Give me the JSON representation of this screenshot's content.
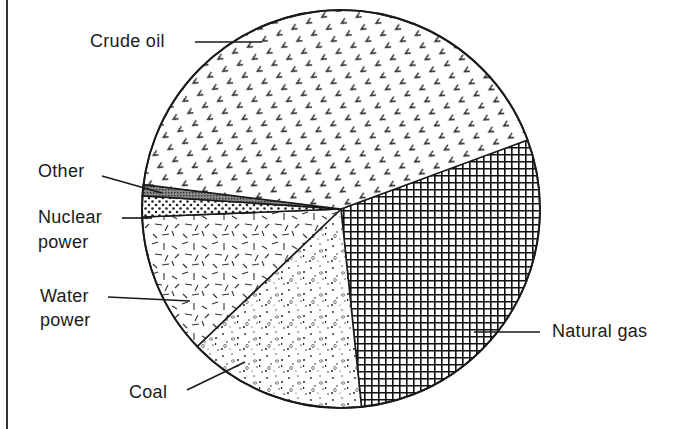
{
  "chart_data": {
    "type": "pie",
    "title": "",
    "start_angle_deg": 69.7,
    "direction": "clockwise",
    "units": "percent (estimated from slice angles)",
    "categories": [
      "Natural gas",
      "Coal",
      "Water power",
      "Nuclear power",
      "Other",
      "Crude oil"
    ],
    "values": [
      29.0,
      14.5,
      11.5,
      1.7,
      0.9,
      42.4
    ],
    "patterns": [
      "crosshatch-grid",
      "stipple-dots-circles",
      "random-dashes",
      "dot-grid",
      "dense-dark-stipple",
      "chevron-marks"
    ],
    "labels": {
      "crude_oil": "Crude oil",
      "other": "Other",
      "nuclear_line1": "Nuclear",
      "nuclear_line2": "power",
      "water_line1": "Water",
      "water_line2": "power",
      "coal": "Coal",
      "natural_gas": "Natural gas"
    },
    "legend": "none (leader-line labels)",
    "colors": {
      "ink": "#1a1a1a",
      "background": "#ffffff"
    }
  }
}
